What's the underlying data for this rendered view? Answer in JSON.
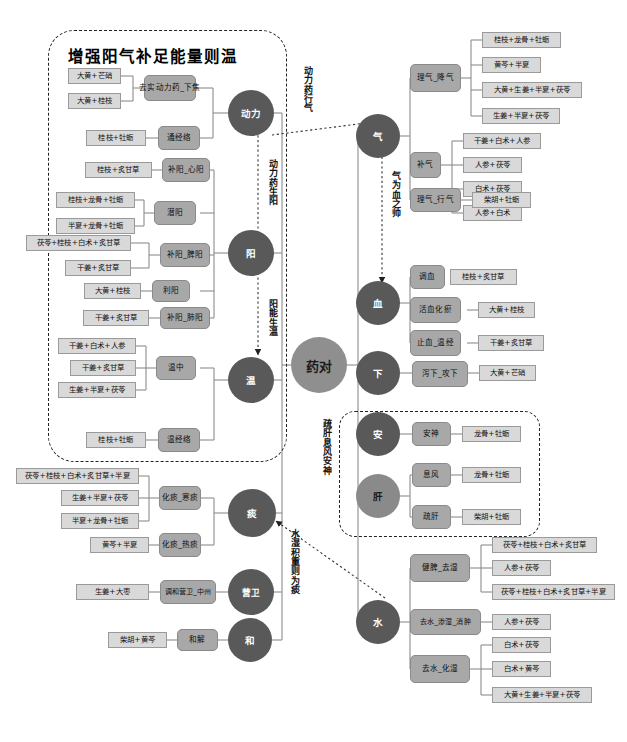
{
  "diagram": {
    "type": "mindmap-tree",
    "hub": {
      "label": "药对"
    },
    "section_title": "增强阳气补足能量则温",
    "colors": {
      "leaf_fill": "#d9d9d9",
      "mid_fill": "#a8a8a8",
      "circle_fill": "#595959",
      "circle_light_fill": "#8a8a8a",
      "hub_fill": "#8f8f8f",
      "line": "#7f7f7f",
      "dashed": "#222222",
      "background": "#ffffff"
    },
    "relations": [
      {
        "name": "dongli-yao-xingqi",
        "label": "动力药行气",
        "from": "动力",
        "to": "气"
      },
      {
        "name": "dongli-yao-shengyang",
        "label": "动力药生阳",
        "from": "动力",
        "to": "阳"
      },
      {
        "name": "yang-neng-shengwen",
        "label": "阳能生温",
        "from": "阳",
        "to": "温"
      },
      {
        "name": "qi-wei-xue-zhi-shuai",
        "label": "气为血之帅",
        "from": "气",
        "to": "血"
      },
      {
        "name": "shugan-xifeng-anshen",
        "label": "疏肝息风安神",
        "from": "肝",
        "to": "安"
      },
      {
        "name": "shuishi-jizhong-zewei-tan",
        "label": "水湿积重则为痰",
        "from": "水",
        "to": "痰"
      }
    ],
    "left_branches": [
      {
        "circle": "动力",
        "groups": [
          {
            "mid": "去实动力药_下焦",
            "leaves": [
              "大黄+芒硝",
              "大黄+桂枝"
            ]
          },
          {
            "mid": "通经络",
            "leaves": [
              "桂枝+牡蛎"
            ]
          }
        ]
      },
      {
        "circle": "阳",
        "groups": [
          {
            "mid": "补阳_心阳",
            "leaves": [
              "桂枝+炙甘草"
            ]
          },
          {
            "mid": "潜阳",
            "leaves": [
              "桂枝+龙骨+牡蛎",
              "半夏+龙骨+牡蛎"
            ]
          },
          {
            "mid": "补阳_脾阳",
            "leaves": [
              "茯苓+桂枝+白术+炙甘草",
              "干姜+炙甘草"
            ]
          },
          {
            "mid": "利阳",
            "leaves": [
              "大黄+桂枝"
            ]
          },
          {
            "mid": "补阳_肺阳",
            "leaves": [
              "干姜+炙甘草"
            ]
          }
        ]
      },
      {
        "circle": "温",
        "groups": [
          {
            "mid": "温中",
            "leaves": [
              "干姜+白术+人参",
              "干姜+炙甘草",
              "生姜+半夏+茯苓"
            ]
          },
          {
            "mid": "温经络",
            "leaves": [
              "桂枝+牡蛎"
            ]
          }
        ]
      },
      {
        "circle": "痰",
        "groups": [
          {
            "mid": "化痰_寒痰",
            "leaves": [
              "茯苓+桂枝+白术+炙甘草+半夏",
              "生姜+半夏+茯苓",
              "半夏+龙骨+牡蛎"
            ]
          },
          {
            "mid": "化痰_热痰",
            "leaves": [
              "黄芩+半夏"
            ]
          }
        ]
      },
      {
        "circle": "营卫",
        "groups": [
          {
            "mid": "调和营卫_中州",
            "leaves": [
              "生姜+大枣"
            ]
          }
        ]
      },
      {
        "circle": "和",
        "groups": [
          {
            "mid": "和解",
            "leaves": [
              "柴胡+黄芩"
            ]
          }
        ]
      }
    ],
    "right_branches": [
      {
        "circle": "气",
        "groups": [
          {
            "mid": "理气_降气",
            "leaves": [
              "桂枝+龙骨+牡蛎",
              "黄芩+半夏",
              "大黄+生姜+半夏+茯苓",
              "生姜+半夏+茯苓"
            ]
          },
          {
            "mid": "补气",
            "leaves": [
              "干姜+白术+人参",
              "人参+茯苓",
              "白术+茯苓",
              "人参+白术"
            ]
          },
          {
            "mid": "理气_行气",
            "leaves": [
              "柴胡+牡蛎"
            ]
          }
        ]
      },
      {
        "circle": "血",
        "groups": [
          {
            "mid": "调血",
            "leaves": [
              "桂枝+炙甘草"
            ]
          },
          {
            "mid": "活血化瘀",
            "leaves": [
              "大黄+桂枝"
            ]
          },
          {
            "mid": "止血_温经",
            "leaves": [
              "干姜+炙甘草"
            ]
          }
        ]
      },
      {
        "circle": "下",
        "groups": [
          {
            "mid": "泻下_攻下",
            "leaves": [
              "大黄+芒硝"
            ]
          }
        ]
      },
      {
        "circle": "安",
        "groups": [
          {
            "mid": "安神",
            "leaves": [
              "龙骨+牡蛎"
            ]
          }
        ]
      },
      {
        "circle": "肝",
        "groups": [
          {
            "mid": "息风",
            "leaves": [
              "龙骨+牡蛎"
            ]
          },
          {
            "mid": "疏肝",
            "leaves": [
              "柴胡+牡蛎"
            ]
          }
        ]
      },
      {
        "circle": "水",
        "groups": [
          {
            "mid": "健脾_去湿",
            "leaves": [
              "茯苓+桂枝+白术+炙甘草",
              "人参+茯苓",
              "茯苓+桂枝+白术+炙甘草+半夏"
            ]
          },
          {
            "mid": "去水_渗湿_消肿",
            "leaves": [
              "人参+茯苓"
            ]
          },
          {
            "mid": "去水_化湿",
            "leaves": [
              "白术+茯苓",
              "白术+黄芩",
              "大黄+生姜+半夏+茯苓"
            ]
          }
        ]
      }
    ]
  }
}
